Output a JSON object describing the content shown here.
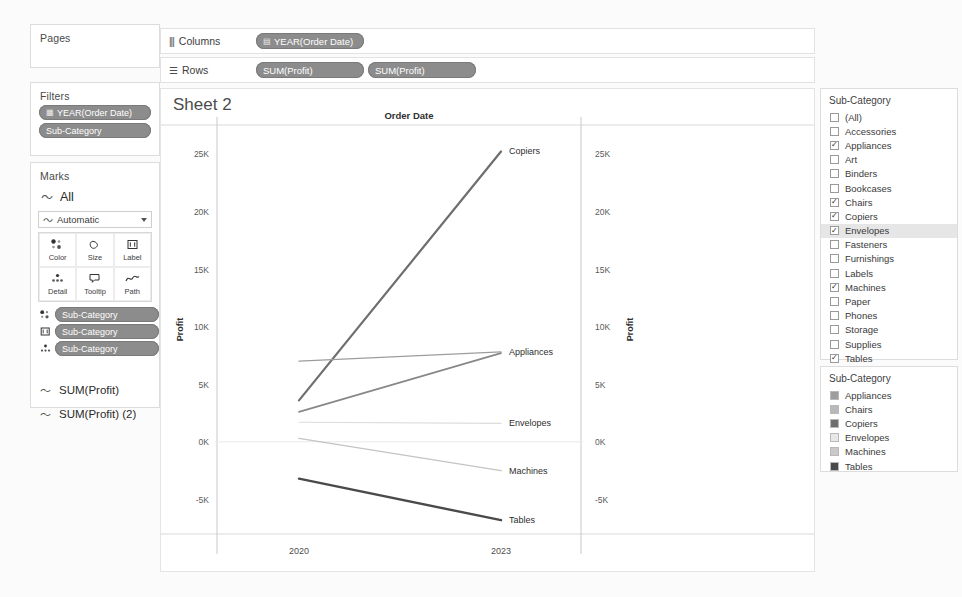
{
  "left_panel": {
    "pages": {
      "title": "Pages"
    },
    "filters": {
      "title": "Filters",
      "pills": [
        {
          "label": "YEAR(Order Date)",
          "icon": "calendar-icon"
        },
        {
          "label": "Sub-Category",
          "icon": ""
        }
      ]
    },
    "marks": {
      "title": "Marks",
      "all_label": "All",
      "all_icon": "line-mark-icon",
      "mark_type": "Automatic",
      "mark_type_icon": "line-mark-icon",
      "buttons": [
        {
          "label": "Color",
          "icon": "color-icon"
        },
        {
          "label": "Size",
          "icon": "size-icon"
        },
        {
          "label": "Label",
          "icon": "label-icon"
        },
        {
          "label": "Detail",
          "icon": "detail-icon"
        },
        {
          "label": "Tooltip",
          "icon": "tooltip-icon"
        },
        {
          "label": "Path",
          "icon": "path-icon"
        }
      ],
      "encoding_pills": [
        {
          "label": "Sub-Category",
          "icon": "color-icon"
        },
        {
          "label": "Sub-Category",
          "icon": "label-icon"
        },
        {
          "label": "Sub-Category",
          "icon": "detail-icon"
        }
      ]
    },
    "measure_cards": [
      {
        "label": "SUM(Profit)",
        "icon": "line-mark-icon"
      },
      {
        "label": "SUM(Profit) (2)",
        "icon": "line-mark-icon"
      }
    ]
  },
  "shelves": {
    "columns": {
      "label": "Columns",
      "icon": "columns-icon",
      "pills": [
        {
          "label": "YEAR(Order Date)",
          "icon": "calendar-icon"
        }
      ]
    },
    "rows": {
      "label": "Rows",
      "icon": "rows-icon",
      "pills": [
        {
          "label": "SUM(Profit)",
          "icon": ""
        },
        {
          "label": "SUM(Profit)",
          "icon": ""
        }
      ]
    }
  },
  "viz": {
    "sheet_title": "Sheet 2"
  },
  "right_panel": {
    "filter": {
      "title": "Sub-Category",
      "items": [
        {
          "label": "(All)",
          "checked": false,
          "highlighted": false
        },
        {
          "label": "Accessories",
          "checked": false,
          "highlighted": false
        },
        {
          "label": "Appliances",
          "checked": true,
          "highlighted": false
        },
        {
          "label": "Art",
          "checked": false,
          "highlighted": false
        },
        {
          "label": "Binders",
          "checked": false,
          "highlighted": false
        },
        {
          "label": "Bookcases",
          "checked": false,
          "highlighted": false
        },
        {
          "label": "Chairs",
          "checked": true,
          "highlighted": false
        },
        {
          "label": "Copiers",
          "checked": true,
          "highlighted": false
        },
        {
          "label": "Envelopes",
          "checked": true,
          "highlighted": true
        },
        {
          "label": "Fasteners",
          "checked": false,
          "highlighted": false
        },
        {
          "label": "Furnishings",
          "checked": false,
          "highlighted": false
        },
        {
          "label": "Labels",
          "checked": false,
          "highlighted": false
        },
        {
          "label": "Machines",
          "checked": true,
          "highlighted": false
        },
        {
          "label": "Paper",
          "checked": false,
          "highlighted": false
        },
        {
          "label": "Phones",
          "checked": false,
          "highlighted": false
        },
        {
          "label": "Storage",
          "checked": false,
          "highlighted": false
        },
        {
          "label": "Supplies",
          "checked": false,
          "highlighted": false
        },
        {
          "label": "Tables",
          "checked": true,
          "highlighted": false
        }
      ],
      "check_glyph": "✓"
    },
    "legend": {
      "title": "Sub-Category",
      "items": [
        {
          "label": "Appliances",
          "color": "#9d9d9d"
        },
        {
          "label": "Chairs",
          "color": "#b8b8b8"
        },
        {
          "label": "Copiers",
          "color": "#6e6e6e"
        },
        {
          "label": "Envelopes",
          "color": "#e8e8e8"
        },
        {
          "label": "Machines",
          "color": "#c9c9c9"
        },
        {
          "label": "Tables",
          "color": "#4a4a4a"
        }
      ]
    }
  },
  "chart_data": {
    "type": "line",
    "title": "Order Date",
    "xlabel": "Order Date",
    "ylabel": "Profit",
    "ylabel_right": "Profit",
    "x": [
      "2020",
      "2023"
    ],
    "xtick_labels": [
      "2020",
      "2023"
    ],
    "ytick_labels": [
      "25K",
      "20K",
      "15K",
      "10K",
      "5K",
      "0K",
      "-5K"
    ],
    "ytick_values": [
      25000,
      20000,
      15000,
      10000,
      5000,
      0,
      -5000
    ],
    "ytick_labels_right": [
      "25K",
      "20K",
      "15K",
      "10K",
      "5K",
      "0K",
      "-5K"
    ],
    "ylim": [
      -8000,
      27500
    ],
    "grid": false,
    "legend_position": "right-outside",
    "series": [
      {
        "name": "Copiers",
        "values": [
          3600,
          25200
        ],
        "color": "#6e6e6e",
        "width": 2.2,
        "label": "Copiers"
      },
      {
        "name": "Appliances",
        "values": [
          7000,
          7800
        ],
        "color": "#9d9d9d",
        "width": 1.3,
        "label": "Appliances"
      },
      {
        "name": "Chairs",
        "values": [
          2600,
          7700
        ],
        "color": "#888888",
        "width": 1.7,
        "label": ""
      },
      {
        "name": "Envelopes",
        "values": [
          1700,
          1600
        ],
        "color": "#dcdcdc",
        "width": 1.1,
        "label": "Envelopes"
      },
      {
        "name": "Machines",
        "values": [
          300,
          -2500
        ],
        "color": "#c4c4c4",
        "width": 1.5,
        "label": "Machines"
      },
      {
        "name": "Tables",
        "values": [
          -3200,
          -6800
        ],
        "color": "#4a4a4a",
        "width": 2.4,
        "label": "Tables"
      }
    ],
    "annotations": [
      "Copiers",
      "Appliances",
      "Envelopes",
      "Machines",
      "Tables"
    ]
  }
}
